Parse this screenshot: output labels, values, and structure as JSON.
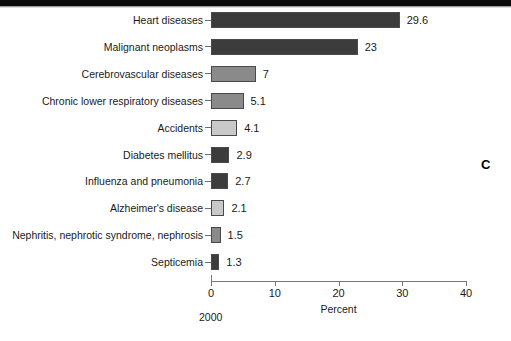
{
  "figure": {
    "panel_letter": "C",
    "year_note": "2000"
  },
  "chart_data": {
    "type": "bar",
    "orientation": "horizontal",
    "title": "",
    "xlabel": "Percent",
    "ylabel": "",
    "xlim": [
      0,
      40
    ],
    "xticks": [
      0,
      10,
      20,
      30,
      40
    ],
    "xtick_labels": [
      "0",
      "10",
      "20",
      "30",
      "40"
    ],
    "grid": false,
    "legend": null,
    "categories": [
      "Heart diseases",
      "Malignant neoplasms",
      "Cerebrovascular diseases",
      "Chronic lower respiratory diseases",
      "Accidents",
      "Diabetes mellitus",
      "Influenza and pneumonia",
      "Alzheimer's disease",
      "Nephritis, nephrotic syndrome, nephrosis",
      "Septicemia"
    ],
    "values": [
      29.6,
      23,
      7,
      5.1,
      4.1,
      2.9,
      2.7,
      2.1,
      1.5,
      1.3
    ],
    "value_labels": [
      "29.6",
      "23",
      "7",
      "5.1",
      "4.1",
      "2.9",
      "2.7",
      "2.1",
      "1.5",
      "1.3"
    ],
    "bar_colors": [
      "#3c3c3c",
      "#3c3c3c",
      "#8a8a8a",
      "#8a8a8a",
      "#c9c9c9",
      "#3c3c3c",
      "#3c3c3c",
      "#c9c9c9",
      "#8a8a8a",
      "#3c3c3c"
    ]
  }
}
